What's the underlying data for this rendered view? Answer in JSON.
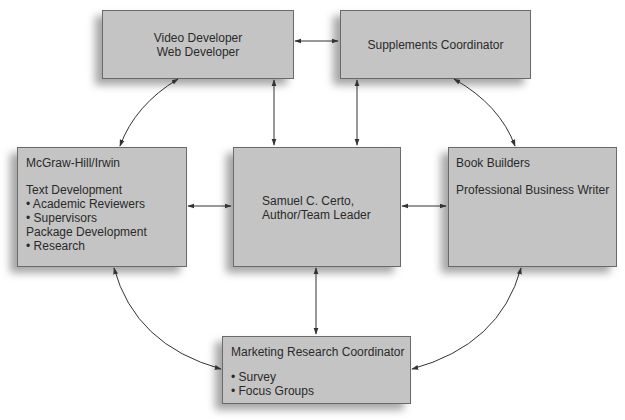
{
  "nodes": {
    "video": {
      "lines": [
        "Video Developer",
        "Web Developer"
      ]
    },
    "supplements": {
      "lines": [
        "Supplements Coordinator"
      ]
    },
    "mcgraw": {
      "title": "McGraw-Hill/Irwin",
      "lines": [
        "Text Development",
        "• Academic Reviewers",
        "• Supervisors",
        "Package Development",
        "• Research"
      ]
    },
    "certo": {
      "lines": [
        "Samuel C. Certo,",
        "Author/Team Leader"
      ]
    },
    "bookbuilders": {
      "title": "Book Builders",
      "lines": [
        "Professional Business Writer"
      ]
    },
    "marketing": {
      "title": "Marketing Research Coordinator",
      "lines": [
        "• Survey",
        "• Focus Groups"
      ]
    }
  },
  "edges": [
    [
      "video",
      "supplements"
    ],
    [
      "video",
      "certo"
    ],
    [
      "supplements",
      "certo"
    ],
    [
      "video",
      "mcgraw"
    ],
    [
      "supplements",
      "bookbuilders"
    ],
    [
      "mcgraw",
      "certo"
    ],
    [
      "certo",
      "bookbuilders"
    ],
    [
      "certo",
      "marketing"
    ],
    [
      "mcgraw",
      "marketing"
    ],
    [
      "bookbuilders",
      "marketing"
    ]
  ],
  "colors": {
    "box_fill": "#c4c4c4",
    "box_border": "#6a6a6a",
    "line": "#333333"
  }
}
